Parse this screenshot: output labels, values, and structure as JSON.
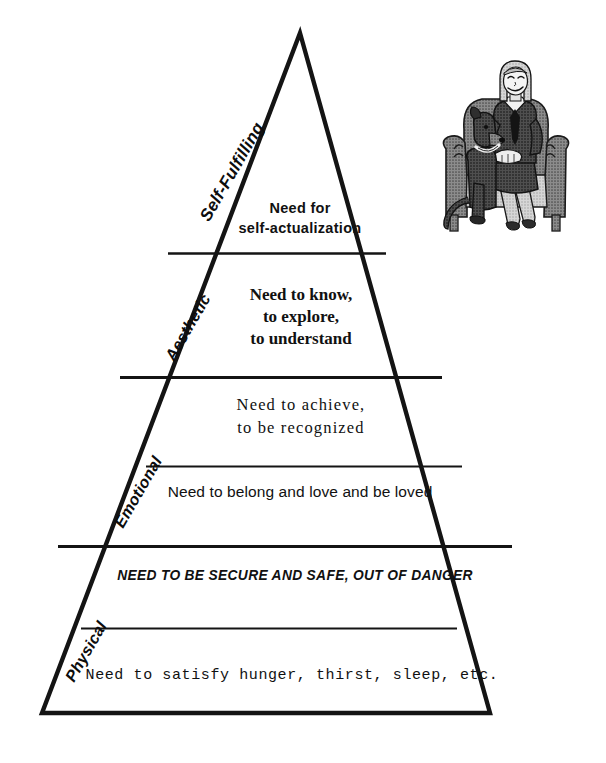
{
  "diagram": {
    "name": "Hierarchy of Needs Pyramid",
    "type": "pyramid",
    "line_color": "#141414",
    "background": "#ffffff",
    "tiers": [
      {
        "index": 1,
        "category": "Self-Fulfilling",
        "text": "Need for\nself-actualization",
        "style": "bold-sans"
      },
      {
        "index": 2,
        "category": "Aesthetic",
        "text": "Need to know,\nto explore,\nto understand",
        "style": "bold-serif"
      },
      {
        "index": 3,
        "category": "Emotional",
        "text": "Need  to  achieve,\nto  be  recognized",
        "style": "serif-spaced"
      },
      {
        "index": 4,
        "category": "Emotional",
        "text": "Need to belong and love and be loved",
        "style": "sans"
      },
      {
        "index": 5,
        "category": "Physical",
        "text": "NEED TO BE SECURE AND SAFE, OUT OF DANGER",
        "style": "bold-italic-caps"
      },
      {
        "index": 6,
        "category": "Physical",
        "text": "Need to satisfy hunger, thirst, sleep, etc.",
        "style": "monospace"
      }
    ],
    "slope_labels": [
      {
        "key": "self_fulfilling",
        "text": "Self-Fulfilling"
      },
      {
        "key": "aesthetic",
        "text": "Aesthetic"
      },
      {
        "key": "emotional",
        "text": "Emotional"
      },
      {
        "key": "physical",
        "text": "Physical"
      }
    ],
    "illustration": {
      "name": "woman-seated-in-armchair-with-dog",
      "description": "Grayscale halftone line drawing of a smiling woman with light hair seated in an upholstered armchair, with a dark dog sitting beside her",
      "tones": {
        "dark": "#3a3a3a",
        "mid": "#6e6e6e",
        "light": "#a8a8a8",
        "highlight": "#d8d8d8",
        "outline": "#1a1a1a"
      }
    }
  }
}
